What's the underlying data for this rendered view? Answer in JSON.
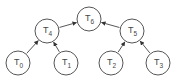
{
  "diagram": {
    "type": "tree",
    "nodes": [
      {
        "id": "T6",
        "base": "T",
        "sub": "6",
        "x": 89,
        "y": 19
      },
      {
        "id": "T4",
        "base": "T",
        "sub": "4",
        "x": 47,
        "y": 31
      },
      {
        "id": "T5",
        "base": "T",
        "sub": "5",
        "x": 132,
        "y": 31
      },
      {
        "id": "T0",
        "base": "T",
        "sub": "0",
        "x": 18,
        "y": 63
      },
      {
        "id": "T1",
        "base": "T",
        "sub": "1",
        "x": 66,
        "y": 63
      },
      {
        "id": "T2",
        "base": "T",
        "sub": "2",
        "x": 111,
        "y": 63
      },
      {
        "id": "T3",
        "base": "T",
        "sub": "3",
        "x": 158,
        "y": 63
      }
    ],
    "edges": [
      {
        "from": "T4",
        "to": "T6"
      },
      {
        "from": "T5",
        "to": "T6"
      },
      {
        "from": "T0",
        "to": "T4"
      },
      {
        "from": "T1",
        "to": "T4"
      },
      {
        "from": "T2",
        "to": "T5"
      },
      {
        "from": "T3",
        "to": "T5"
      }
    ],
    "colors": {
      "stroke": "#555555",
      "fill": "#ffffff",
      "text": "#444444"
    }
  }
}
